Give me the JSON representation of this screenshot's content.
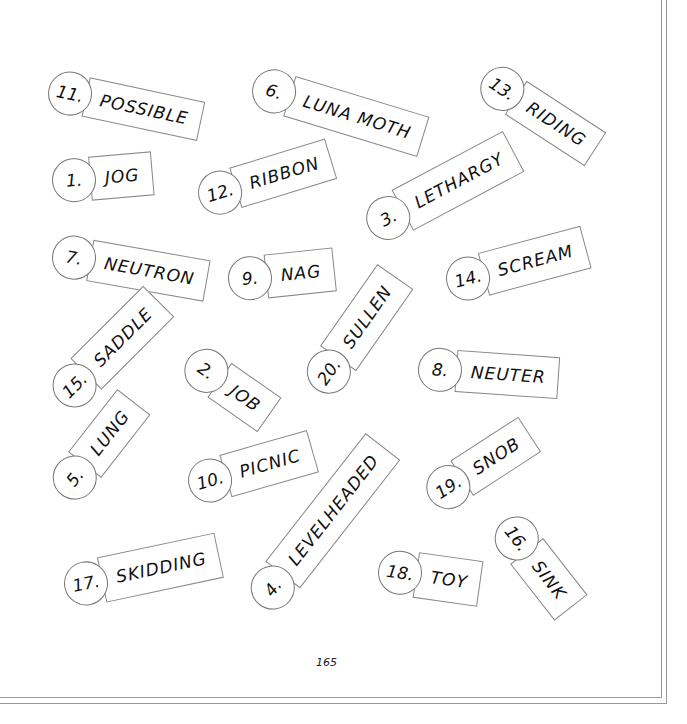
{
  "page": {
    "page_number": "165"
  },
  "tags": [
    {
      "number": "11.",
      "word": "POSSIBLE"
    },
    {
      "number": "6.",
      "word": "LUNA MOTH"
    },
    {
      "number": "13.",
      "word": "RIDING"
    },
    {
      "number": "1.",
      "word": "JOG"
    },
    {
      "number": "12.",
      "word": "RIBBON"
    },
    {
      "number": "3.",
      "word": "LETHARGY"
    },
    {
      "number": "7.",
      "word": "NEUTRON"
    },
    {
      "number": "9.",
      "word": "NAG"
    },
    {
      "number": "14.",
      "word": "SCREAM"
    },
    {
      "number": "20.",
      "word": "SULLEN"
    },
    {
      "number": "15.",
      "word": "SADDLE"
    },
    {
      "number": "2.",
      "word": "JOB"
    },
    {
      "number": "8.",
      "word": "NEUTER"
    },
    {
      "number": "5.",
      "word": "LUNG"
    },
    {
      "number": "10.",
      "word": "PICNIC"
    },
    {
      "number": "4.",
      "word": "LEVELHEADED"
    },
    {
      "number": "19.",
      "word": "SNOB"
    },
    {
      "number": "16.",
      "word": "SINK"
    },
    {
      "number": "17.",
      "word": "SKIDDING"
    },
    {
      "number": "18.",
      "word": "TOY"
    }
  ]
}
